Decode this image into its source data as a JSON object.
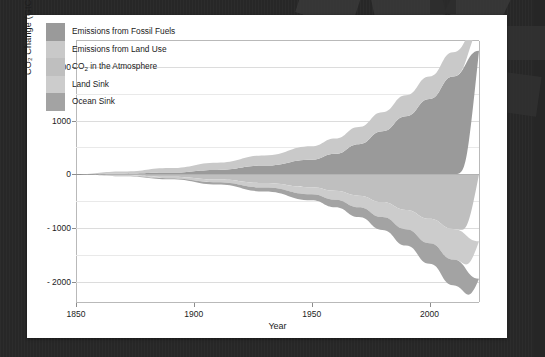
{
  "background": {
    "color": "#272727",
    "card_color": "#ffffff"
  },
  "chart_data": {
    "type": "area",
    "title": "",
    "xlabel": "Year",
    "ylabel": "CO₂ Change (GtCO₂)",
    "xlim": [
      1850,
      2021
    ],
    "ylim": [
      -2400,
      2500
    ],
    "xticks": [
      "1850",
      "1900",
      "1950",
      "2000"
    ],
    "xtick_values": [
      1850,
      1900,
      1950,
      2000
    ],
    "yticks": [
      "2000",
      "1000",
      "0",
      "- 1000",
      "- 2000"
    ],
    "ytick_values": [
      2000,
      1000,
      0,
      -1000,
      -2000
    ],
    "minor_gridlines": [
      1500,
      500,
      -500,
      -1500
    ],
    "grid": true,
    "stacked": true,
    "legend_position": "top-left",
    "x": [
      1850,
      1870,
      1890,
      1910,
      1930,
      1950,
      1960,
      1970,
      1980,
      1990,
      2000,
      2010,
      2021
    ],
    "series": [
      {
        "name": "Emissions from Fossil Fuels",
        "color": "#9a9a9a",
        "direction": "positive",
        "units": "GtCO2 cumulative",
        "values": [
          0,
          10,
          30,
          80,
          160,
          270,
          380,
          560,
          800,
          1080,
          1400,
          1820,
          2300
        ]
      },
      {
        "name": "Emissions from Land Use",
        "color": "#c9c9c9",
        "direction": "positive",
        "units": "GtCO2 cumulative",
        "values": [
          0,
          40,
          85,
          135,
          190,
          250,
          285,
          320,
          355,
          390,
          420,
          450,
          480
        ]
      },
      {
        "name": "CO₂ in the Atmosphere",
        "color": "#bfbfbf",
        "direction": "negative",
        "units": "GtCO2 cumulative",
        "values": [
          0,
          -20,
          -50,
          -100,
          -165,
          -245,
          -310,
          -400,
          -520,
          -665,
          -830,
          -1020,
          -1250
        ]
      },
      {
        "name": "Land Sink",
        "color": "#cccccc",
        "direction": "negative",
        "units": "GtCO2 cumulative",
        "values": [
          0,
          -10,
          -25,
          -50,
          -85,
          -130,
          -165,
          -215,
          -280,
          -360,
          -455,
          -570,
          -700
        ]
      },
      {
        "name": "Ocean Sink",
        "color": "#a3a3a3",
        "direction": "negative",
        "units": "GtCO2 cumulative",
        "values": [
          0,
          -8,
          -20,
          -42,
          -72,
          -112,
          -142,
          -185,
          -240,
          -305,
          -385,
          -480,
          -590
        ]
      }
    ]
  },
  "legend": {
    "items": [
      {
        "label": "Emissions from Fossil Fuels",
        "color": "#9a9a9a"
      },
      {
        "label": "Emissions from Land Use",
        "color": "#c9c9c9"
      },
      {
        "label": "CO",
        "label_sub": "2",
        "label_rest": " in the Atmosphere",
        "color": "#bfbfbf"
      },
      {
        "label": "Land Sink",
        "color": "#cccccc"
      },
      {
        "label": "Ocean Sink",
        "color": "#a3a3a3"
      }
    ]
  }
}
